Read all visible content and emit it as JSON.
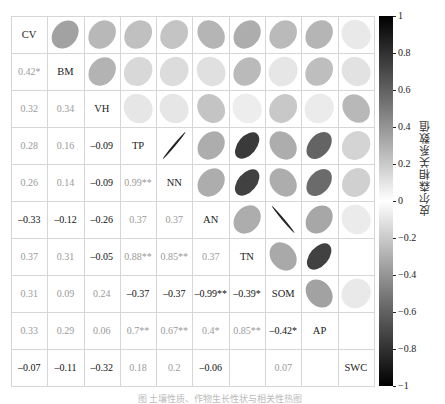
{
  "chart_data": {
    "type": "heatmap",
    "subtype": "correlation-matrix-mixed",
    "title": "",
    "lower_triangle": "numeric coefficients with significance stars",
    "upper_triangle": "ellipses (tilt = sign, narrowness & gray = |r|)",
    "variables": [
      "CV",
      "BM",
      "VH",
      "TP",
      "NN",
      "AN",
      "TN",
      "SOM",
      "AP",
      "SWC"
    ],
    "matrix_labels": [
      [
        "CV",
        "",
        "",
        "",
        "",
        "",
        "",
        "",
        "",
        ""
      ],
      [
        "0.42*",
        "BM",
        "",
        "",
        "",
        "",
        "",
        "",
        "",
        ""
      ],
      [
        "0.32",
        "0.34",
        "VH",
        "",
        "",
        "",
        "",
        "",
        "",
        ""
      ],
      [
        "0.28",
        "0.16",
        "-0.09",
        "TP",
        "",
        "",
        "",
        "",
        "",
        ""
      ],
      [
        "0.26",
        "0.14",
        "-0.09",
        "0.99**",
        "NN",
        "",
        "",
        "",
        "",
        ""
      ],
      [
        "-0.33",
        "-0.12",
        "-0.26",
        "0.37",
        "0.37",
        "AN",
        "",
        "",
        "",
        ""
      ],
      [
        "0.37",
        "0.31",
        "-0.05",
        "0.88**",
        "0.85**",
        "0.37",
        "TN",
        "",
        "",
        ""
      ],
      [
        "0.31",
        "0.09",
        "0.24",
        "-0.37",
        "-0.37",
        "-0.99**",
        "-0.39*",
        "SOM",
        "",
        ""
      ],
      [
        "0.33",
        "0.29",
        "0.06",
        "0.7**",
        "0.67**",
        "0.4*",
        "0.85**",
        "-0.42*",
        "AP",
        ""
      ],
      [
        "-0.07",
        "-0.11",
        "-0.32",
        "0.18",
        "0.2",
        "-0.06",
        "",
        "0.07",
        "",
        "SWC"
      ]
    ],
    "matrix_values": [
      [
        1,
        0.42,
        0.32,
        0.28,
        0.26,
        -0.33,
        0.37,
        0.31,
        0.33,
        -0.07
      ],
      [
        0.42,
        1,
        0.34,
        0.16,
        0.14,
        -0.12,
        0.31,
        0.09,
        0.29,
        -0.11
      ],
      [
        0.32,
        0.34,
        1,
        -0.09,
        -0.09,
        -0.26,
        -0.05,
        0.24,
        0.06,
        -0.32
      ],
      [
        0.28,
        0.16,
        -0.09,
        1,
        0.99,
        0.37,
        0.88,
        -0.37,
        0.7,
        0.18
      ],
      [
        0.26,
        0.14,
        -0.09,
        0.99,
        1,
        0.37,
        0.85,
        -0.37,
        0.67,
        0.2
      ],
      [
        -0.33,
        -0.12,
        -0.26,
        0.37,
        0.37,
        1,
        0.37,
        -0.99,
        0.4,
        -0.06
      ],
      [
        0.37,
        0.31,
        -0.05,
        0.88,
        0.85,
        0.37,
        1,
        -0.39,
        0.85,
        0.0
      ],
      [
        0.31,
        0.09,
        0.24,
        -0.37,
        -0.37,
        -0.99,
        -0.39,
        1,
        -0.42,
        0.07
      ],
      [
        0.33,
        0.29,
        0.06,
        0.7,
        0.67,
        0.4,
        0.85,
        -0.42,
        1,
        0.0
      ],
      [
        -0.07,
        -0.11,
        -0.32,
        0.18,
        0.2,
        -0.06,
        0.0,
        0.07,
        0.0,
        1
      ]
    ],
    "colorbar": {
      "label": "皮尔森相关系数值",
      "ticks": [
        "1",
        "0.8",
        "0.6",
        "0.4",
        "0.2",
        "0",
        "-0.2",
        "-0.4",
        "-0.6",
        "-0.8",
        "-1"
      ],
      "range": [
        -1,
        1
      ],
      "colors": {
        "extreme": "#000000",
        "zero": "#ffffff"
      }
    },
    "legend_position": "right",
    "grid": true
  },
  "caption": "图 土壤性质、作物生长性状与相关性热图"
}
